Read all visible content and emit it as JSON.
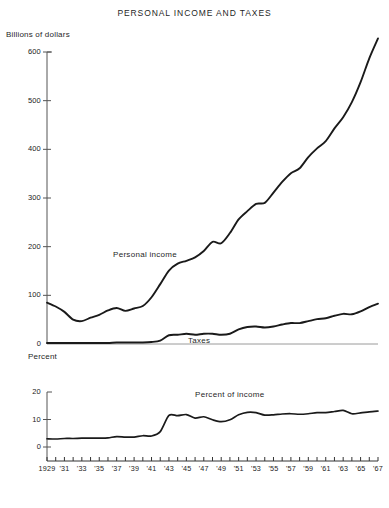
{
  "chart": {
    "title": "PERSONAL INCOME AND TAXES",
    "upper_axis_name": "Billions of dollars",
    "lower_axis_name": "Percent",
    "series_labels": {
      "personal_income": "Personal income",
      "taxes": "Taxes",
      "percent_of_income": "Percent of income"
    },
    "upper_ticks": [
      "600",
      "500",
      "400",
      "300",
      "200",
      "100",
      "0"
    ],
    "lower_ticks": [
      "20",
      "10",
      "0"
    ],
    "xtick_labels": [
      "1929",
      "'31",
      "'33",
      "'35",
      "'37",
      "'39",
      "'41",
      "'43",
      "'45",
      "'47",
      "'49",
      "'51",
      "'53",
      "'55",
      "'57",
      "'59",
      "'61",
      "'63",
      "'65",
      "'67"
    ]
  },
  "chart_data": {
    "type": "line",
    "title": "PERSONAL INCOME AND TAXES",
    "xlabel": "",
    "grid": false,
    "legend": "inline-annotations",
    "panels": [
      {
        "name": "upper",
        "ylabel": "Billions of dollars",
        "ylim": [
          0,
          600
        ],
        "yticks": [
          0,
          100,
          200,
          300,
          400,
          500,
          600
        ],
        "xlim": [
          1929,
          1967
        ],
        "xticks": [
          1929,
          1930,
          1931,
          1932,
          1933,
          1934,
          1935,
          1936,
          1937,
          1938,
          1939,
          1940,
          1941,
          1942,
          1943,
          1944,
          1945,
          1946,
          1947,
          1948,
          1949,
          1950,
          1951,
          1952,
          1953,
          1954,
          1955,
          1956,
          1957,
          1958,
          1959,
          1960,
          1961,
          1962,
          1963,
          1964,
          1965,
          1966,
          1967
        ],
        "series": [
          {
            "name": "Personal income",
            "x": [
              1929,
              1930,
              1931,
              1932,
              1933,
              1934,
              1935,
              1936,
              1937,
              1938,
              1939,
              1940,
              1941,
              1942,
              1943,
              1944,
              1945,
              1946,
              1947,
              1948,
              1949,
              1950,
              1951,
              1952,
              1953,
              1954,
              1955,
              1956,
              1957,
              1958,
              1959,
              1960,
              1961,
              1962,
              1963,
              1964,
              1965,
              1966,
              1967
            ],
            "values": [
              85,
              77,
              66,
              50,
              47,
              54,
              60,
              69,
              74,
              68,
              73,
              78,
              96,
              123,
              151,
              165,
              171,
              178,
              191,
              210,
              207,
              228,
              256,
              273,
              288,
              290,
              311,
              333,
              351,
              361,
              384,
              402,
              417,
              443,
              466,
              497,
              538,
              587,
              628
            ]
          },
          {
            "name": "Taxes",
            "x": [
              1929,
              1930,
              1931,
              1932,
              1933,
              1934,
              1935,
              1936,
              1937,
              1938,
              1939,
              1940,
              1941,
              1942,
              1943,
              1944,
              1945,
              1946,
              1947,
              1948,
              1949,
              1950,
              1951,
              1952,
              1953,
              1954,
              1955,
              1956,
              1957,
              1958,
              1959,
              1960,
              1961,
              1962,
              1963,
              1964,
              1965,
              1966,
              1967
            ],
            "values": [
              2,
              2,
              2,
              2,
              2,
              2,
              2,
              2,
              3,
              3,
              3,
              3,
              4,
              7,
              18,
              19,
              21,
              19,
              21,
              21,
              19,
              21,
              30,
              35,
              36,
              34,
              36,
              40,
              43,
              43,
              47,
              51,
              53,
              58,
              62,
              61,
              67,
              76,
              83
            ]
          }
        ]
      },
      {
        "name": "lower",
        "ylabel": "Percent",
        "ylim": [
          0,
          20
        ],
        "yticks": [
          0,
          10,
          20
        ],
        "xlim": [
          1929,
          1967
        ],
        "series": [
          {
            "name": "Percent of income",
            "x": [
              1929,
              1930,
              1931,
              1932,
              1933,
              1934,
              1935,
              1936,
              1937,
              1938,
              1939,
              1940,
              1941,
              1942,
              1943,
              1944,
              1945,
              1946,
              1947,
              1948,
              1949,
              1950,
              1951,
              1952,
              1953,
              1954,
              1955,
              1956,
              1957,
              1958,
              1959,
              1960,
              1961,
              1962,
              1963,
              1964,
              1965,
              1966,
              1967
            ],
            "values": [
              3.0,
              2.9,
              3.1,
              3.1,
              3.2,
              3.2,
              3.2,
              3.3,
              3.8,
              3.6,
              3.6,
              4.1,
              4.0,
              5.6,
              11.5,
              11.4,
              11.8,
              10.5,
              11.0,
              9.9,
              9.2,
              9.9,
              11.7,
              12.6,
              12.5,
              11.6,
              11.7,
              12.0,
              12.1,
              11.9,
              12.1,
              12.5,
              12.5,
              12.9,
              13.3,
              12.1,
              12.4,
              12.8,
              13.1
            ]
          }
        ]
      }
    ]
  }
}
